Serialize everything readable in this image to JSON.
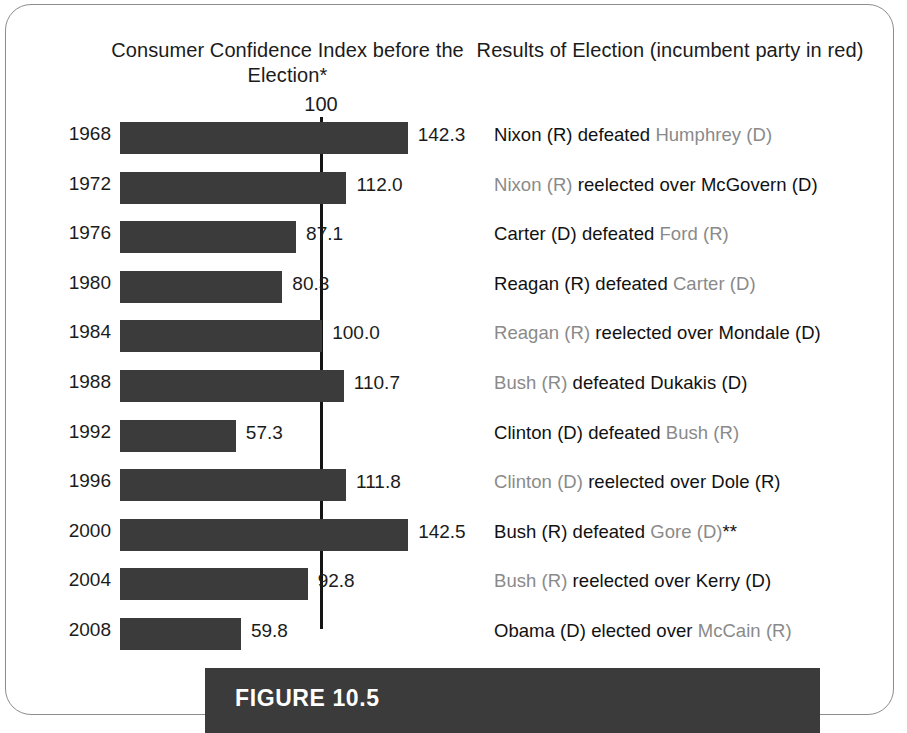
{
  "figure": {
    "caption": "FIGURE 10.5"
  },
  "headers": {
    "chart_title": "Consumer Confidence Index before the Election*",
    "results_title": "Results of Election (incumbent party in red)"
  },
  "axis": {
    "reference_label": "100"
  },
  "chart_data": {
    "type": "bar",
    "title": "Consumer Confidence Index before the Election*",
    "xlabel": "",
    "ylabel": "",
    "orientation": "horizontal",
    "reference_line": 100,
    "xlim": [
      0,
      150
    ],
    "grid": false,
    "legend": false,
    "categories": [
      "1968",
      "1972",
      "1976",
      "1980",
      "1984",
      "1988",
      "1992",
      "1996",
      "2000",
      "2004",
      "2008"
    ],
    "values": [
      142.3,
      112.0,
      87.1,
      80.3,
      100.0,
      110.7,
      57.3,
      111.8,
      142.5,
      92.8,
      59.8
    ],
    "value_labels": [
      "142.3",
      "112.0",
      "87.1",
      "80.3",
      "100.0",
      "110.7",
      "57.3",
      "111.8",
      "142.5",
      "92.8",
      "59.8"
    ],
    "bar_color": "#3b3b3b",
    "reference_line_color": "#141414"
  },
  "rows": [
    {
      "year": "1968",
      "value": 142.3,
      "value_label": "142.3",
      "result_pre": "Nixon (R) defeated ",
      "result_incumbent": "Humphrey (D)",
      "result_post": "",
      "incumbent_position": "second"
    },
    {
      "year": "1972",
      "value": 112.0,
      "value_label": "112.0",
      "result_pre": "",
      "result_incumbent": "Nixon (R)",
      "result_post": " reelected over McGovern (D)",
      "incumbent_position": "first"
    },
    {
      "year": "1976",
      "value": 87.1,
      "value_label": "87.1",
      "result_pre": "Carter (D) defeated ",
      "result_incumbent": "Ford (R)",
      "result_post": "",
      "incumbent_position": "second"
    },
    {
      "year": "1980",
      "value": 80.3,
      "value_label": "80.3",
      "result_pre": "Reagan (R) defeated ",
      "result_incumbent": "Carter (D)",
      "result_post": "",
      "incumbent_position": "second"
    },
    {
      "year": "1984",
      "value": 100.0,
      "value_label": "100.0",
      "result_pre": "",
      "result_incumbent": "Reagan (R)",
      "result_post": " reelected over Mondale (D)",
      "incumbent_position": "first"
    },
    {
      "year": "1988",
      "value": 110.7,
      "value_label": "110.7",
      "result_pre": "",
      "result_incumbent": "Bush (R)",
      "result_post": " defeated Dukakis (D)",
      "incumbent_position": "first"
    },
    {
      "year": "1992",
      "value": 57.3,
      "value_label": "57.3",
      "result_pre": "Clinton (D) defeated ",
      "result_incumbent": "Bush (R)",
      "result_post": "",
      "incumbent_position": "second"
    },
    {
      "year": "1996",
      "value": 111.8,
      "value_label": "111.8",
      "result_pre": "",
      "result_incumbent": "Clinton (D)",
      "result_post": " reelected over Dole (R)",
      "incumbent_position": "first"
    },
    {
      "year": "2000",
      "value": 142.5,
      "value_label": "142.5",
      "result_pre": "Bush (R) defeated ",
      "result_incumbent": "Gore (D)",
      "result_post": "**",
      "incumbent_position": "second"
    },
    {
      "year": "2004",
      "value": 92.8,
      "value_label": "92.8",
      "result_pre": "",
      "result_incumbent": "Bush (R)",
      "result_post": " reelected over Kerry (D)",
      "incumbent_position": "first"
    },
    {
      "year": "2008",
      "value": 59.8,
      "value_label": "59.8",
      "result_pre": "Obama (D) elected over ",
      "result_incumbent": "McCain (R)",
      "result_post": "",
      "incumbent_position": "second"
    }
  ],
  "layout": {
    "bar_origin_x": 120,
    "px_per_unit": 2.022,
    "row_top_start": 116,
    "row_pitch": 49.6
  },
  "colors": {
    "bar": "#3b3b3b",
    "incumbent_text": "#8a8a8a",
    "text": "#111111",
    "caption_bar": "#3b3b3b"
  }
}
